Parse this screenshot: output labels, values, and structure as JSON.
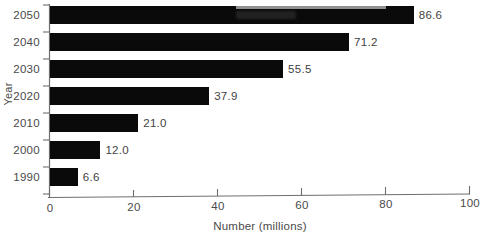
{
  "chart_data": {
    "type": "bar",
    "orientation": "horizontal",
    "title": "",
    "xlabel": "Number (millions)",
    "ylabel": "Year",
    "categories": [
      "1990",
      "2000",
      "2010",
      "2020",
      "2030",
      "2040",
      "2050"
    ],
    "values": [
      6.6,
      12.0,
      21.0,
      37.9,
      55.5,
      71.2,
      86.6
    ],
    "data_labels": [
      "6.6",
      "12.0",
      "21.0",
      "37.9",
      "55.5",
      "71.2",
      "86.6"
    ],
    "xlim": [
      0,
      100
    ],
    "xticks": [
      0,
      20,
      40,
      60,
      80,
      100
    ],
    "xtick_labels": [
      "0",
      "20",
      "40",
      "60",
      "80",
      "100"
    ],
    "ytick_labels": [
      "2050",
      "2040",
      "2030",
      "2020",
      "2010",
      "2000",
      "1990"
    ],
    "grid": false,
    "legend": null,
    "bar_color": "#0a0a0a",
    "axis_color": "#6e6e6e",
    "display_order_top_to_bottom": [
      "2050",
      "2040",
      "2030",
      "2020",
      "2010",
      "2000",
      "1990"
    ],
    "display_values_top_to_bottom": [
      86.6,
      71.2,
      55.5,
      37.9,
      21.0,
      12.0,
      6.6
    ]
  }
}
